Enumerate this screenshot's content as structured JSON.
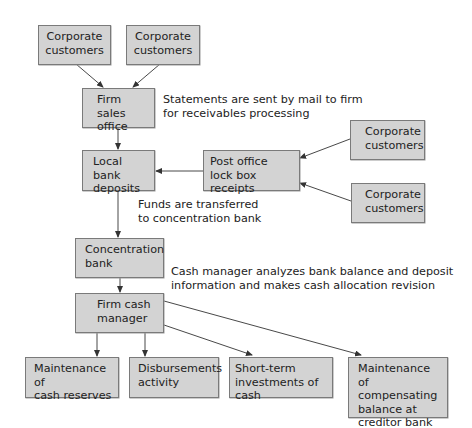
{
  "diagram": {
    "nodes": {
      "corp1": "Corporate\ncustomers",
      "corp2": "Corporate\ncustomers",
      "sales": "Firm sales\noffice",
      "local": "Local bank\ndeposits",
      "postoffice": "Post office\nlock box receipts",
      "corp3": "Corporate\ncustomers",
      "corp4": "Corporate\ncustomers",
      "concentration": "Concentration\nbank",
      "cashmgr": "Firm cash\nmanager",
      "reserves": "Maintenance of\ncash reserves",
      "disburse": "Disbursements\nactivity",
      "shortterm": "Short-term\ninvestments of cash",
      "compensating": "Maintenance of\ncompensating\nbalance at\ncreditor bank"
    },
    "notes": {
      "statements": "Statements are sent by mail to firm\nfor receivables processing",
      "funds": "Funds are transferred\nto concentration bank",
      "analysis": "Cash manager analyzes bank balance and deposit\ninformation and makes cash allocation revision"
    },
    "edges": [
      {
        "from": "corp1",
        "to": "sales"
      },
      {
        "from": "corp2",
        "to": "sales"
      },
      {
        "from": "sales",
        "to": "local"
      },
      {
        "from": "postoffice",
        "to": "local"
      },
      {
        "from": "corp3",
        "to": "postoffice"
      },
      {
        "from": "corp4",
        "to": "postoffice"
      },
      {
        "from": "local",
        "to": "concentration"
      },
      {
        "from": "concentration",
        "to": "cashmgr"
      },
      {
        "from": "cashmgr",
        "to": "reserves"
      },
      {
        "from": "cashmgr",
        "to": "disburse"
      },
      {
        "from": "cashmgr",
        "to": "shortterm"
      },
      {
        "from": "cashmgr",
        "to": "compensating"
      }
    ],
    "colors": {
      "box_fill": "#d3d3d3",
      "box_border": "#7a7a7a",
      "line": "#333333"
    }
  }
}
